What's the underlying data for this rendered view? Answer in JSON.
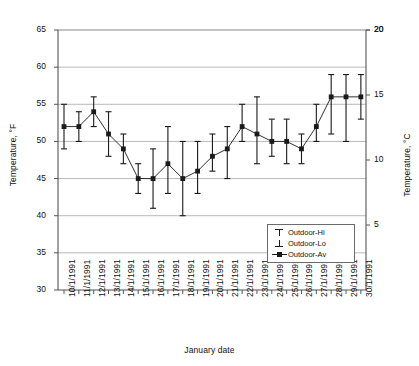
{
  "chart_data": {
    "type": "line",
    "title": "",
    "xlabel": "January date",
    "ylabel": "Temperature, °F",
    "ylabel_right": "Temperature, °C",
    "ylim": [
      30,
      65
    ],
    "ylim_right": [
      0,
      20
    ],
    "yticks": [
      30,
      35,
      40,
      45,
      50,
      55,
      60,
      65
    ],
    "yticks_right": [
      5,
      10,
      15,
      20
    ],
    "grid": true,
    "legend_position": "inside-lower-right",
    "categories": [
      "10/1/1991",
      "11/1/1991",
      "12/1/1991",
      "13/1/1991",
      "14/1/1991",
      "15/1/1991",
      "16/1/1991",
      "17/1/1991",
      "18/1/1991",
      "19/1/1991",
      "20/1/1991",
      "21/1/1991",
      "22/1/1991",
      "23/1/1991",
      "24/1/1991",
      "25/1/1991",
      "26/1/1991",
      "27/1/1991",
      "28/1/1991",
      "29/1/1991",
      "30/1/1991"
    ],
    "series": [
      {
        "name": "Outdoor-Hi",
        "values": [
          55,
          54,
          56,
          54,
          51,
          47,
          49,
          52,
          50,
          50,
          51,
          52,
          55,
          56,
          53,
          53,
          51,
          55,
          59,
          59,
          59
        ]
      },
      {
        "name": "Outdoor-Lo",
        "values": [
          49,
          50,
          52,
          48,
          47,
          43,
          41,
          43,
          40,
          43,
          46,
          45,
          50,
          47,
          48,
          47,
          47,
          50,
          51,
          50,
          53
        ]
      },
      {
        "name": "Outdoor-Av",
        "values": [
          52,
          52,
          54,
          51,
          49,
          45,
          45,
          47,
          45,
          46,
          48,
          49,
          52,
          51,
          50,
          50,
          49,
          52,
          56,
          56,
          56
        ]
      }
    ]
  },
  "legend": {
    "items": [
      {
        "label": "Outdoor-Hi",
        "key": "tee-up-marker"
      },
      {
        "label": "Outdoor-Lo",
        "key": "tee-down-marker"
      },
      {
        "label": "Outdoor-Av",
        "key": "line-square-marker"
      }
    ]
  },
  "colors": {
    "series_line": "#1a1a1a",
    "grid": "#9a9a9a",
    "axis": "#555555",
    "background": "#ffffff"
  },
  "caption": ""
}
